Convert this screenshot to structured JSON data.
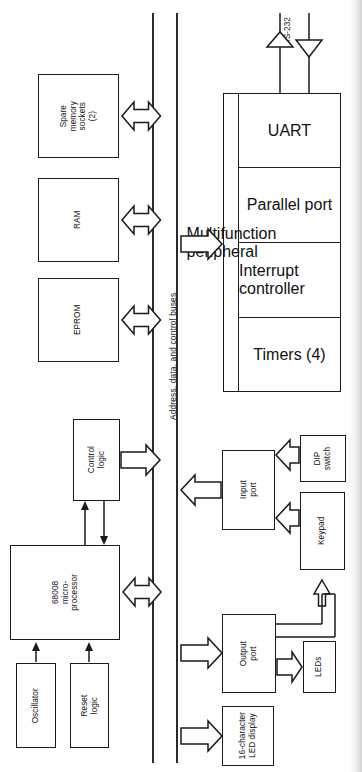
{
  "diagram": {
    "type": "block-diagram",
    "orientation": "rotated-90-counterclockwise",
    "bus": {
      "label": "Address, data, and control buses",
      "rails": 2
    },
    "blocks": {
      "eprom": "EPROM",
      "ram": "RAM",
      "spare_memory": "Spare\nmemory\nsockets\n(2)",
      "control_logic": "Control\nlogic",
      "cpu": "68008\nmicro-\nprocessor",
      "oscillator": "Oscillator",
      "reset_logic": "Reset\nlogic",
      "mfp": "Multifunction peripheral",
      "uart": "UART",
      "parallel_port": "Parallel\nport",
      "interrupt_controller": "Interrupt\ncontroller",
      "timers": "Timers\n(4)",
      "input_port": "Input\nport",
      "dip_switch": "DIP\nswitch",
      "keypad": "Keypad",
      "output_port": "Output\nport",
      "leds": "LEDs",
      "led_display": "16-character\nLED display"
    },
    "signals": {
      "rs232": "RS-232"
    },
    "colors": {
      "ink": "#1a1a1a",
      "paper": "#fefefe",
      "rail": "#2a2a2a"
    }
  }
}
